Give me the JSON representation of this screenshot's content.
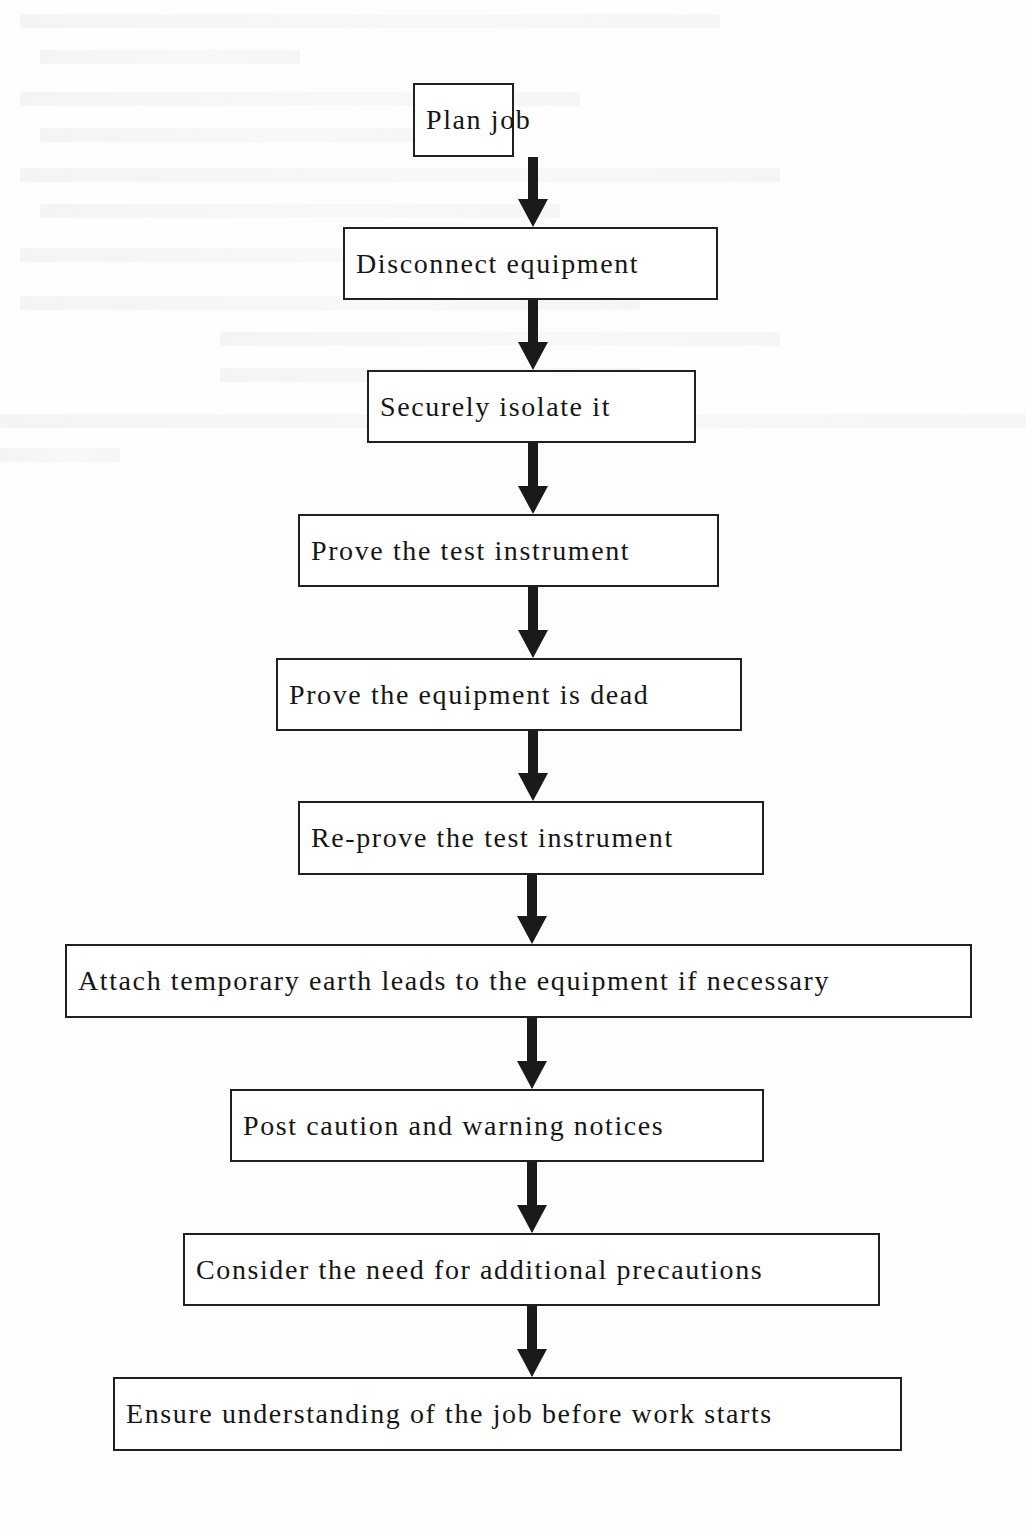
{
  "diagram": {
    "type": "flowchart",
    "direction": "top-to-bottom",
    "colors": {
      "box_border": "#202020",
      "arrow": "#1a1a1a",
      "text": "#161616",
      "background": "#fdfdfd"
    },
    "steps": [
      {
        "id": 1,
        "label": "Plan job"
      },
      {
        "id": 2,
        "label": "Disconnect equipment"
      },
      {
        "id": 3,
        "label": "Securely isolate it"
      },
      {
        "id": 4,
        "label": "Prove the test instrument"
      },
      {
        "id": 5,
        "label": "Prove the equipment is dead"
      },
      {
        "id": 6,
        "label": "Re-prove the test instrument"
      },
      {
        "id": 7,
        "label": "Attach temporary earth leads to the equipment if necessary"
      },
      {
        "id": 8,
        "label": "Post caution and warning notices"
      },
      {
        "id": 9,
        "label": "Consider the need for additional precautions"
      },
      {
        "id": 10,
        "label": "Ensure understanding of the job before work starts"
      }
    ],
    "edges": [
      {
        "from": 1,
        "to": 2
      },
      {
        "from": 2,
        "to": 3
      },
      {
        "from": 3,
        "to": 4
      },
      {
        "from": 4,
        "to": 5
      },
      {
        "from": 5,
        "to": 6
      },
      {
        "from": 6,
        "to": 7
      },
      {
        "from": 7,
        "to": 8
      },
      {
        "from": 8,
        "to": 9
      },
      {
        "from": 9,
        "to": 10
      }
    ]
  }
}
